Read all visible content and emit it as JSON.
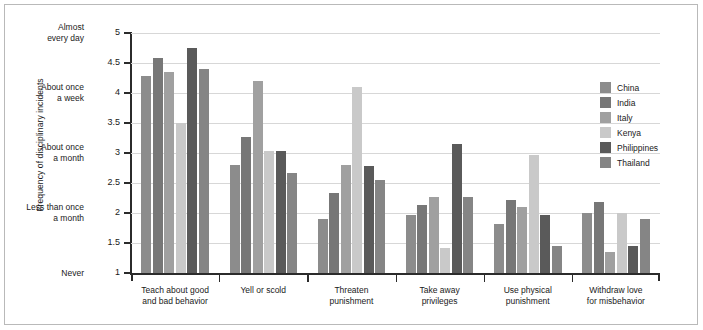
{
  "chart_data": {
    "type": "bar",
    "title": "",
    "xlabel": "",
    "ylabel": "Frequency of disciplinary incidents",
    "ylim": [
      1,
      5
    ],
    "grid": true,
    "legend_position": "right",
    "categories": [
      "Teach about good and bad behavior",
      "Yell or scold",
      "Threaten punishment",
      "Take away privileges",
      "Use physical punishment",
      "Withdraw love for misbehavior"
    ],
    "category_lines": [
      [
        "Teach about good",
        "and bad behavior"
      ],
      [
        "Yell or scold",
        ""
      ],
      [
        "Threaten",
        "punishment"
      ],
      [
        "Take away",
        "privileges"
      ],
      [
        "Use physical",
        "punishment"
      ],
      [
        "Withdraw love",
        "for misbehavior"
      ]
    ],
    "ytick_values": [
      1,
      1.5,
      2,
      2.5,
      3,
      3.5,
      4,
      4.5,
      5
    ],
    "ytick_labels": [
      "1",
      "1.5",
      "2",
      "2.5",
      "3",
      "3.5",
      "4",
      "4.5",
      "5"
    ],
    "yanchor_labels": [
      {
        "value": 5,
        "lines": [
          "Almost",
          "every day"
        ]
      },
      {
        "value": 4,
        "lines": [
          "About once",
          "a week"
        ]
      },
      {
        "value": 3,
        "lines": [
          "About once",
          "a month"
        ]
      },
      {
        "value": 2,
        "lines": [
          "Less than once",
          "a month"
        ]
      },
      {
        "value": 1,
        "lines": [
          "Never",
          ""
        ]
      }
    ],
    "series": [
      {
        "name": "China",
        "color": "#8c8c8c",
        "values": [
          4.28,
          2.8,
          1.9,
          1.97,
          1.82,
          2.0
        ]
      },
      {
        "name": "India",
        "color": "#777777",
        "values": [
          4.58,
          3.27,
          2.33,
          2.13,
          2.22,
          2.18
        ]
      },
      {
        "name": "Italy",
        "color": "#a0a0a0",
        "values": [
          4.35,
          4.2,
          2.8,
          2.27,
          2.1,
          1.35
        ]
      },
      {
        "name": "Kenya",
        "color": "#c9c9c9",
        "values": [
          3.5,
          3.03,
          4.1,
          1.42,
          2.97,
          2.0
        ]
      },
      {
        "name": "Philippines",
        "color": "#5a5a5a",
        "values": [
          4.75,
          3.03,
          2.78,
          3.15,
          1.97,
          1.45
        ]
      },
      {
        "name": "Thailand",
        "color": "#858585",
        "values": [
          4.4,
          2.66,
          2.55,
          2.27,
          1.45,
          1.9
        ]
      }
    ]
  },
  "legend": {
    "items": [
      "China",
      "India",
      "Italy",
      "Kenya",
      "Philippines",
      "Thailand"
    ]
  }
}
